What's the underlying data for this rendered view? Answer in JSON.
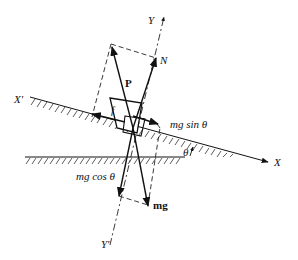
{
  "diagram": {
    "colors": {
      "ink": "#111111",
      "background": "#ffffff"
    },
    "axes": {
      "x_pos": "X",
      "x_neg": "X'",
      "y_pos": "Y",
      "y_neg": "Y'"
    },
    "forces": {
      "applied": "P",
      "normal": "N",
      "friction": "f",
      "weight_parallel": "mg sin θ",
      "weight_perpendicular": "mg cos θ",
      "weight": "mg"
    },
    "angle_label": "θ"
  }
}
